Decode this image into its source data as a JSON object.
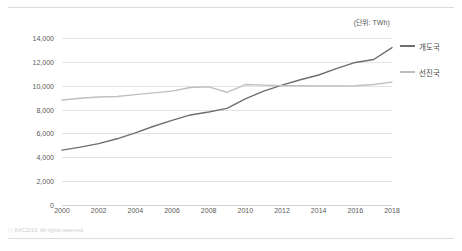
{
  "unit_label": "(단위: TWh)",
  "footer": {
    "copyright": "ⓒ KAC2019. All rights reserved."
  },
  "legend": {
    "position": "right",
    "items": [
      {
        "label": "개도국",
        "color": "#6e6e6e"
      },
      {
        "label": "선진국",
        "color": "#bfbfbf"
      }
    ]
  },
  "colors": {
    "developing": "#6e6e6e",
    "developed": "#bfbfbf",
    "gridline": "#e3e3e3",
    "axis": "#d2d2d2",
    "rule": "#dcdcdc",
    "tick_text": "#5a5a5a"
  },
  "axes": {
    "y_ticks": [
      "14,000",
      "12,000",
      "10,000",
      "8,000",
      "6,000",
      "4,000",
      "2,000",
      "0"
    ],
    "y_tick_values": [
      14000,
      12000,
      10000,
      8000,
      6000,
      4000,
      2000,
      0
    ],
    "x_ticks": [
      "2000",
      "2002",
      "2004",
      "2006",
      "2008",
      "2010",
      "2012",
      "2014",
      "2016",
      "2018"
    ],
    "x_tick_values": [
      2000,
      2002,
      2004,
      2006,
      2008,
      2010,
      2012,
      2014,
      2016,
      2018
    ]
  },
  "chart_data": {
    "type": "line",
    "title": "",
    "subtitle": "",
    "xlabel": "",
    "ylabel": "",
    "unit": "TWh",
    "unit_annotation": "(단위: TWh)",
    "xlim": [
      2000,
      2018
    ],
    "ylim": [
      0,
      14000
    ],
    "ytick_step": 2000,
    "grid": true,
    "legend_position": "right",
    "x": [
      2000,
      2001,
      2002,
      2003,
      2004,
      2005,
      2006,
      2007,
      2008,
      2009,
      2010,
      2011,
      2012,
      2013,
      2014,
      2015,
      2016,
      2017,
      2018
    ],
    "series": [
      {
        "name": "개도국",
        "color": "#6e6e6e",
        "values": [
          4600,
          4850,
          5150,
          5550,
          6050,
          6600,
          7100,
          7550,
          7800,
          8100,
          8900,
          9550,
          10050,
          10500,
          10900,
          11450,
          11950,
          12200,
          13200
        ]
      },
      {
        "name": "선진국",
        "color": "#bfbfbf",
        "values": [
          8800,
          8950,
          9050,
          9100,
          9250,
          9400,
          9550,
          9850,
          9900,
          9450,
          10100,
          10050,
          10000,
          10000,
          9980,
          9980,
          10000,
          10100,
          10300
        ]
      }
    ]
  }
}
